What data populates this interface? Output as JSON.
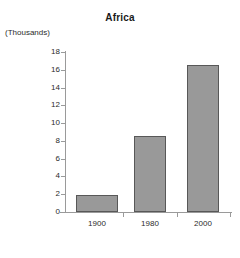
{
  "chart_data": {
    "type": "bar",
    "title": "Africa",
    "xlabel": "",
    "ylabel": "(Thousands)",
    "categories": [
      "1900",
      "1980",
      "2000"
    ],
    "values": [
      1.9,
      8.6,
      16.5
    ],
    "ylim": [
      0,
      18
    ],
    "ytick_step": 2,
    "yticks": [
      0,
      2,
      4,
      6,
      8,
      10,
      12,
      14,
      16,
      18
    ],
    "ytick_labels": [
      "0",
      "2",
      "4",
      "6",
      "8",
      "10",
      "12",
      "14",
      "16",
      "18"
    ],
    "grid": false,
    "legend": null,
    "series": [
      {
        "name": "Africa",
        "values": [
          1.9,
          8.6,
          16.5
        ]
      }
    ],
    "bar_color": "#999999",
    "bar_border_color": "#585858",
    "axis_color": "#9a9a9a",
    "text_color": "#2b2b2b",
    "background": "#ffffff"
  }
}
